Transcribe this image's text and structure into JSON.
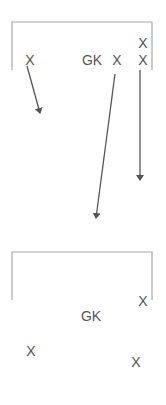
{
  "diagram": {
    "type": "set-piece-drill",
    "colors": {
      "line": "#a8a8a8",
      "arrow": "#555555",
      "text": "#555555"
    },
    "top_goal": {
      "left": 12,
      "right": 152,
      "top": 22,
      "bottom": 70
    },
    "bottom_goal": {
      "left": 12,
      "right": 152,
      "top": 252,
      "bottom": 300
    },
    "top_players": [
      {
        "label": "X",
        "x": 30,
        "y": 60
      },
      {
        "label": "GK",
        "x": 92,
        "y": 60
      },
      {
        "label": "X",
        "x": 117,
        "y": 60
      },
      {
        "label": "X",
        "x": 143,
        "y": 43
      },
      {
        "label": "X",
        "x": 143,
        "y": 60
      }
    ],
    "bottom_players": [
      {
        "label": "X",
        "x": 143,
        "y": 301
      },
      {
        "label": "GK",
        "x": 91,
        "y": 316
      },
      {
        "label": "X",
        "x": 31,
        "y": 351
      },
      {
        "label": "X",
        "x": 136,
        "y": 362
      }
    ],
    "arrows": [
      {
        "x1": 27,
        "y1": 66,
        "x2": 40,
        "y2": 113
      },
      {
        "x1": 115,
        "y1": 74,
        "x2": 96,
        "y2": 218
      },
      {
        "x1": 140,
        "y1": 70,
        "x2": 140,
        "y2": 180
      }
    ]
  }
}
